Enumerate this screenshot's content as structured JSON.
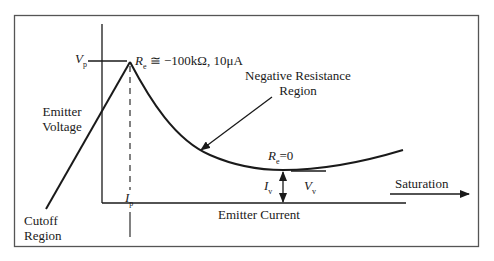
{
  "diagram": {
    "colors": {
      "line": "#1a1a1a",
      "frame": "#555555",
      "background": "#ffffff"
    },
    "axes": {
      "y_axis_label_line1": "Emitter",
      "y_axis_label_line2": "Voltage",
      "x_axis_label": "Emitter Current"
    },
    "peak": {
      "voltage_symbol": "V",
      "voltage_sub": "p",
      "current_symbol": "I",
      "current_sub": "p",
      "resistance_symbol": "R",
      "resistance_sub": "e",
      "resistance_value": "≅ −100kΩ,  10μA"
    },
    "valley": {
      "resistance_symbol": "R",
      "resistance_sub": "e",
      "resistance_value": "=0",
      "voltage_symbol": "V",
      "voltage_sub": "v",
      "current_symbol": "I",
      "current_sub": "v"
    },
    "regions": {
      "cutoff_line1": "Cutoff",
      "cutoff_line2": "Region",
      "negative_line1": "Negative Resistance",
      "negative_line2": "Region",
      "saturation": "Saturation"
    }
  }
}
